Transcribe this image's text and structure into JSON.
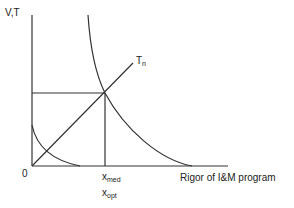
{
  "diagram": {
    "y_axis_label": "V,T",
    "x_axis_label": "Rigor of I&M program",
    "origin_label": "0",
    "line_label": "T",
    "line_label_sub": "n",
    "x_marker_1": "x",
    "x_marker_1_sub": "med",
    "x_marker_2": "x",
    "x_marker_2_sub": "opt",
    "stroke_color": "#333333"
  }
}
